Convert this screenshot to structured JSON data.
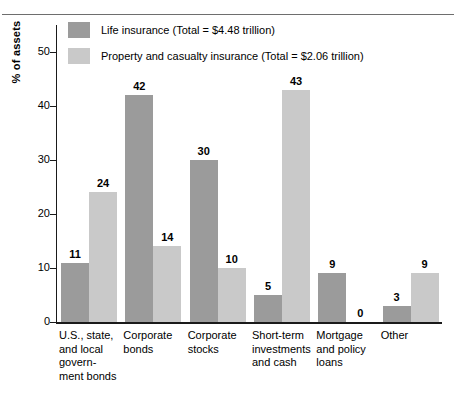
{
  "chart_data": {
    "type": "bar",
    "title": "",
    "subtitle": "",
    "xlabel": "",
    "ylabel": "% of assets",
    "ylim": [
      0,
      55
    ],
    "yticks": [
      0,
      10,
      20,
      30,
      40,
      50
    ],
    "ytick_labels": [
      "0",
      "10",
      "20",
      "30",
      "40",
      "50"
    ],
    "grid": false,
    "legend_position": "inside-top-left",
    "bar_labels_shown": true,
    "categories": [
      "U.S., state, and local govern- ment bonds",
      "Corporate bonds",
      "Corporate stocks",
      "Short-term investments and cash",
      "Mortgage and policy loans",
      "Other"
    ],
    "category_lines": [
      [
        "U.S., state,",
        "and local",
        "govern-",
        "ment bonds"
      ],
      [
        "Corporate",
        "bonds"
      ],
      [
        "Corporate",
        "stocks"
      ],
      [
        "Short-term",
        "investments",
        "and cash"
      ],
      [
        "Mortgage",
        "and policy",
        "loans"
      ],
      [
        "Other"
      ]
    ],
    "series": [
      {
        "name": "Life insurance (Total = $4.48 trillion)",
        "short_name": "Life insurance",
        "total": "$4.48 trillion",
        "color": "#9b9b9b",
        "values": [
          11,
          42,
          30,
          5,
          9,
          3
        ],
        "value_labels": [
          "11",
          "42",
          "30",
          "5",
          "9",
          "3"
        ]
      },
      {
        "name": "Property and casualty insurance (Total = $2.06 trillion)",
        "short_name": "Property and casualty insurance",
        "total": "$2.06 trillion",
        "color": "#c9c9c9",
        "values": [
          24,
          14,
          10,
          43,
          0,
          9
        ],
        "value_labels": [
          "24",
          "14",
          "10",
          "43",
          "0",
          "9"
        ]
      }
    ]
  },
  "colors": {
    "series_dark": "#9b9b9b",
    "series_light": "#c9c9c9",
    "axis": "#1a1a1a",
    "rule": "#6e6e6e",
    "background": "#ffffff"
  }
}
